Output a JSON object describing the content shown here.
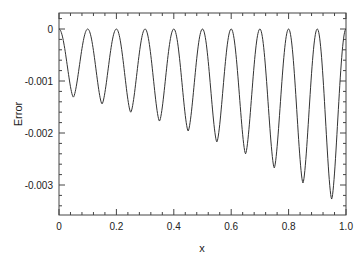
{
  "chart_data": {
    "type": "line",
    "title": "",
    "xlabel": "x",
    "ylabel": "Error",
    "xlim": [
      0,
      1.0
    ],
    "ylim": [
      -0.00355,
      0.0003
    ],
    "grid": false,
    "legend": null,
    "x_ticks": [
      "0",
      "0.2",
      "0.4",
      "0.6",
      "0.8",
      "1.0"
    ],
    "y_ticks": [
      "0",
      "-0.001",
      "-0.002",
      "-0.003"
    ],
    "series": [
      {
        "name": "Error",
        "color": "#333333",
        "zeros_x": [
          0,
          0.1,
          0.2,
          0.3,
          0.4,
          0.5,
          0.6,
          0.7,
          0.8,
          0.9
        ],
        "minima": [
          {
            "x": 0.05,
            "y": -0.00131
          },
          {
            "x": 0.15,
            "y": -0.00144
          },
          {
            "x": 0.25,
            "y": -0.0016
          },
          {
            "x": 0.35,
            "y": -0.00177
          },
          {
            "x": 0.45,
            "y": -0.00196
          },
          {
            "x": 0.55,
            "y": -0.00217
          },
          {
            "x": 0.65,
            "y": -0.0024
          },
          {
            "x": 0.75,
            "y": -0.00267
          },
          {
            "x": 0.85,
            "y": -0.00296
          },
          {
            "x": 0.95,
            "y": -0.00327
          }
        ],
        "end_value": {
          "x": 1.0,
          "y": -0.0027
        }
      }
    ]
  }
}
